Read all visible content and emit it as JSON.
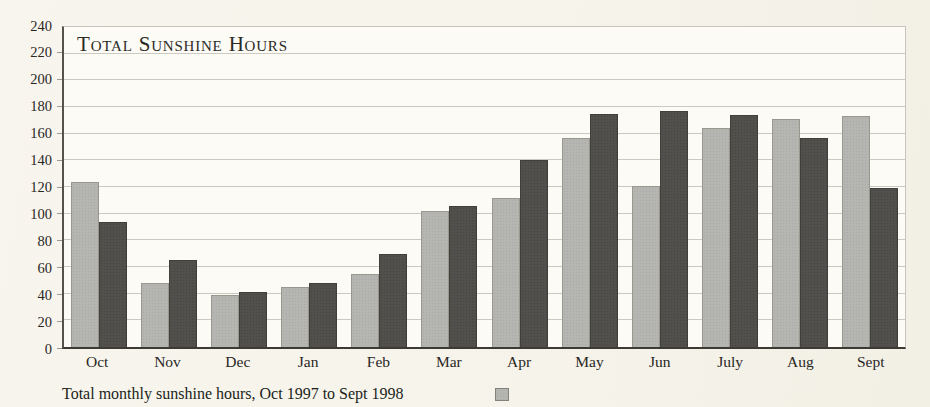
{
  "page": {
    "background_color": "#f6f3ea"
  },
  "chart": {
    "title": "Total Sunshine Hours",
    "caption": "Total monthly sunshine hours, Oct 1997 to Sept 1998",
    "colors": {
      "light_series": "#b5b5b1",
      "dark_series": "#51504c",
      "gridline": "#ccc9c1",
      "axis": "#3c3a34",
      "plot_background": "#fcfbf6"
    },
    "legend": {
      "swatch_color": "#b5b5b1",
      "swatch_series": "light"
    }
  },
  "chart_data": {
    "type": "bar",
    "title": "Total Sunshine Hours",
    "caption": "Total monthly sunshine hours, Oct 1997 to Sept 1998",
    "categories": [
      "Oct",
      "Nov",
      "Dec",
      "Jan",
      "Feb",
      "Mar",
      "Apr",
      "May",
      "Jun",
      "July",
      "Aug",
      "Sept"
    ],
    "series": [
      {
        "name": "light",
        "color": "#b5b5b1",
        "values": [
          124,
          48,
          39,
          45,
          55,
          102,
          112,
          157,
          121,
          164,
          171,
          173
        ]
      },
      {
        "name": "dark",
        "color": "#51504c",
        "values": [
          94,
          65,
          41,
          48,
          70,
          106,
          140,
          175,
          177,
          174,
          157,
          119
        ]
      }
    ],
    "xlabel": "",
    "ylabel": "",
    "ylim": [
      0,
      240
    ],
    "ytick_step": 20,
    "ytick_labels": [
      0,
      20,
      40,
      60,
      80,
      100,
      120,
      140,
      160,
      180,
      200,
      220,
      240
    ],
    "grid": true,
    "legend_position": "bottom-right-of-caption"
  }
}
